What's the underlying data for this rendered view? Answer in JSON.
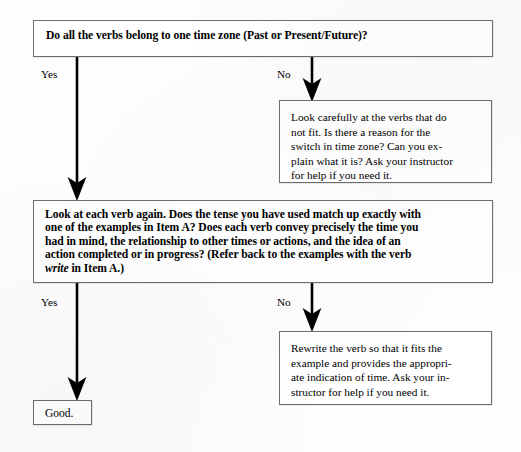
{
  "diagram": {
    "type": "flowchart",
    "background_color": "#fdfdfd",
    "line_color": "#000000",
    "border_color": "#6e6e6e",
    "nodes": [
      {
        "id": "q1",
        "role": "decision",
        "style": "bold",
        "text": "Do all the verbs belong to one time zone (Past or Present/Future)?"
      },
      {
        "id": "no1",
        "role": "action",
        "style": "regular",
        "lines": [
          "Look carefully at the verbs that do",
          "not fit. Is there a reason for the",
          "switch in time zone? Can you ex-",
          "plain what it is? Ask your instructor",
          "for help if you need it."
        ]
      },
      {
        "id": "q2",
        "role": "decision",
        "style": "bold",
        "lines": [
          "Look at each verb again. Does the tense you have used match up exactly with",
          "one of the examples in Item A? Does each verb convey precisely the time you",
          "had in mind, the relationship to other times or actions, and the idea of an",
          "action completed or in progress? (Refer back to the examples with the verb"
        ],
        "last_line_italic_word": "write",
        "last_line_rest": " in Item A.)"
      },
      {
        "id": "no2",
        "role": "action",
        "style": "regular",
        "lines": [
          "Rewrite the verb so that it fits the",
          "example and provides the appropri-",
          "ate indication of time. Ask your in-",
          "structor for help if you need it."
        ]
      },
      {
        "id": "good",
        "role": "terminal",
        "style": "regular",
        "text": "Good."
      }
    ],
    "edges": [
      {
        "id": "e1",
        "from": "q1",
        "to": "q2",
        "label": "Yes"
      },
      {
        "id": "e2",
        "from": "q1",
        "to": "no1",
        "label": "No"
      },
      {
        "id": "e3",
        "from": "q2",
        "to": "good",
        "label": "Yes"
      },
      {
        "id": "e4",
        "from": "q2",
        "to": "no2",
        "label": "No"
      }
    ]
  }
}
